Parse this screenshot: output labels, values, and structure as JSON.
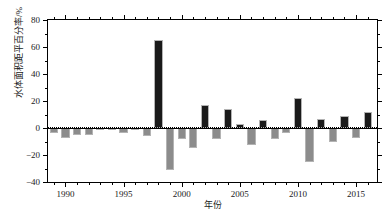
{
  "chart_data": {
    "type": "bar",
    "title": "",
    "xlabel": "年份",
    "ylabel": "水体面积距平百分率/%",
    "xlim": [
      1988.5,
      2016.8
    ],
    "ylim": [
      -40,
      80
    ],
    "yticks": [
      -40,
      -20,
      0,
      20,
      40,
      60,
      80
    ],
    "ytick_labels": [
      "−40",
      "−20",
      "0",
      "20",
      "40",
      "60",
      "80"
    ],
    "yticks_minor": [
      -30,
      -10,
      10,
      30,
      50,
      70
    ],
    "xticks": [
      1990,
      1995,
      2000,
      2005,
      2010,
      2015
    ],
    "xtick_labels": [
      "1990",
      "1995",
      "2000",
      "2005",
      "2010",
      "2015"
    ],
    "xticks_minor": [
      1989,
      1991,
      1992,
      1993,
      1994,
      1996,
      1997,
      1998,
      1999,
      2001,
      2002,
      2003,
      2004,
      2006,
      2007,
      2008,
      2009,
      2011,
      2012,
      2013,
      2014,
      2016
    ],
    "grid": false,
    "legend": null,
    "zero_reference_line": 0,
    "positive_color": "#1a1a1a",
    "negative_color": "#8c8c8c",
    "bar_edge_color": "#b3b3b3",
    "categories": [
      1989,
      1990,
      1991,
      1992,
      1993,
      1994,
      1995,
      1996,
      1997,
      1998,
      1999,
      2000,
      2001,
      2002,
      2003,
      2004,
      2005,
      2006,
      2007,
      2008,
      2009,
      2010,
      2011,
      2012,
      2013,
      2014,
      2015,
      2016
    ],
    "values": [
      -3.5,
      -7.5,
      -5.5,
      -5.5,
      -0.8,
      -0.6,
      -3.5,
      -1.0,
      -6.0,
      65.5,
      -31.0,
      -8.0,
      -14.5,
      16.8,
      -8.0,
      14.0,
      2.8,
      -12.5,
      6.0,
      -8.5,
      -3.5,
      22.5,
      -25.5,
      6.3,
      -10.0,
      9.2,
      -7.5,
      12.2
    ],
    "series": [
      {
        "name": "水体面积距平百分率",
        "values": [
          -3.5,
          -7.5,
          -5.5,
          -5.5,
          -0.8,
          -0.6,
          -3.5,
          -1.0,
          -6.0,
          65.5,
          -31.0,
          -8.0,
          -14.5,
          16.8,
          -8.0,
          14.0,
          2.8,
          -12.5,
          6.0,
          -8.5,
          -3.5,
          22.5,
          -25.5,
          6.3,
          -10.0,
          9.2,
          -7.5,
          12.2
        ]
      }
    ],
    "annotations": []
  },
  "figure": {
    "caption": ""
  }
}
